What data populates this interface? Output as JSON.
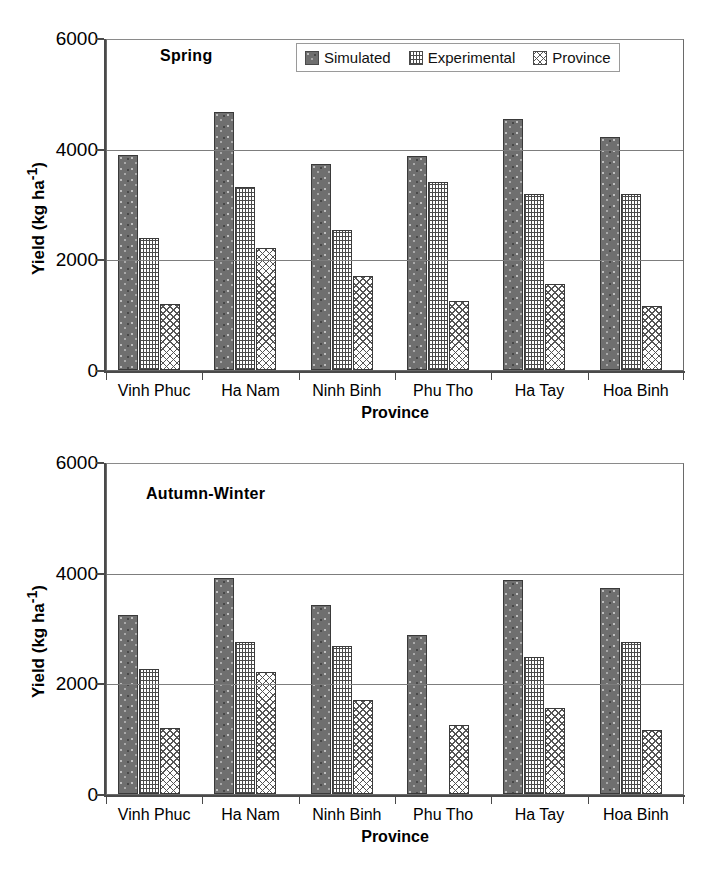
{
  "figure": {
    "legend": {
      "items": [
        {
          "label": "Simulated",
          "pattern": "solid-dark-speckle",
          "color": "#6f6f6f"
        },
        {
          "label": "Experimental",
          "pattern": "fine-grid-dot",
          "color": "#ffffff"
        },
        {
          "label": "Province",
          "pattern": "crosshatch-diamond",
          "color": "#ffffff"
        }
      ]
    }
  },
  "chart_data": [
    {
      "type": "bar",
      "title": "Spring",
      "xlabel": "Province",
      "ylabel": "Yield (kg ha-1)",
      "ylabel_display": "Yield (kg ha",
      "ylabel_sup": "-1",
      "ylabel_tail": ")",
      "categories": [
        "Vinh Phuc",
        "Ha Nam",
        "Ninh Binh",
        "Phu Tho",
        "Ha Tay",
        "Hoa Binh"
      ],
      "ylim": [
        0,
        6000
      ],
      "yticks": [
        0,
        2000,
        4000,
        6000
      ],
      "ytick_labels": [
        "0",
        "2000",
        "4000",
        "6000"
      ],
      "grid": "horizontal",
      "legend_position": "top-right-inside",
      "series": [
        {
          "name": "Simulated",
          "values": [
            3880,
            4670,
            3730,
            3870,
            4540,
            4220
          ]
        },
        {
          "name": "Experimental",
          "values": [
            2380,
            3310,
            2530,
            3390,
            3180,
            3180
          ]
        },
        {
          "name": "Province",
          "values": [
            1200,
            2200,
            1700,
            1250,
            1550,
            1160
          ]
        }
      ]
    },
    {
      "type": "bar",
      "title": "Autumn-Winter",
      "xlabel": "Province",
      "ylabel": "Yield (kg ha-1)",
      "ylabel_display": "Yield (kg ha",
      "ylabel_sup": "-1",
      "ylabel_tail": ")",
      "categories": [
        "Vinh Phuc",
        "Ha Nam",
        "Ninh Binh",
        "Phu Tho",
        "Ha Tay",
        "Hoa Binh"
      ],
      "ylim": [
        0,
        6000
      ],
      "yticks": [
        0,
        2000,
        4000,
        6000
      ],
      "ytick_labels": [
        "0",
        "2000",
        "4000",
        "6000"
      ],
      "grid": "horizontal",
      "legend_position": "none",
      "series": [
        {
          "name": "Simulated",
          "values": [
            3240,
            3900,
            3410,
            2880,
            3870,
            3730
          ]
        },
        {
          "name": "Experimental",
          "values": [
            2260,
            2740,
            2670,
            null,
            2470,
            2750
          ]
        },
        {
          "name": "Province",
          "values": [
            1200,
            2200,
            1700,
            1250,
            1550,
            1160
          ]
        }
      ]
    }
  ]
}
